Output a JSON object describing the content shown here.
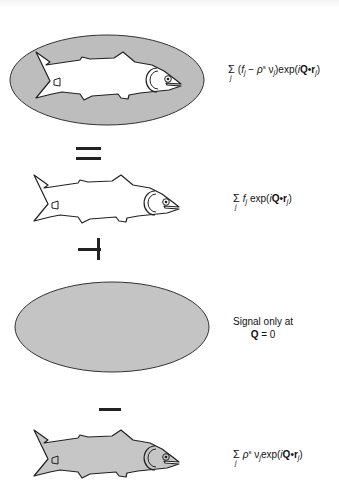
{
  "diagram": {
    "rows": [
      {
        "id": "fish-in-solvent",
        "shape": "ellipse+fish",
        "fish_fill": "#ffffff",
        "ellipse_fill": "#bdbdbd",
        "formula": {
          "sum_index": "j",
          "open": "(",
          "f": "f",
          "f_sub": "j",
          "minus": " − ",
          "rho": "ρ",
          "rho_sup": "s",
          "nu": " ν",
          "nu_sub": "j",
          "close": ")",
          "exp": "exp",
          "lp": "(",
          "i": "i",
          "Q": "Q",
          "dot": "•",
          "r": "r",
          "r_sub": "j",
          "rp": ")"
        }
      },
      {
        "id": "fish-in-vacuum",
        "operator": "=",
        "shape": "fish",
        "fish_fill": "#ffffff",
        "formula": {
          "sum_index": "j",
          "f": "f",
          "f_sub": "j",
          "exp": " exp",
          "lp": "(",
          "i": "i",
          "Q": "Q",
          "dot": "•",
          "r": "r",
          "r_sub": "j",
          "rp": ")"
        }
      },
      {
        "id": "solvent-ellipse",
        "operator": "+",
        "shape": "ellipse",
        "ellipse_fill": "#c4c4c4",
        "note": {
          "line1": "Signal only at",
          "Q": "Q",
          "eq": " = 0"
        }
      },
      {
        "id": "solvent-displaced-fish",
        "operator": "−",
        "shape": "fish",
        "fish_fill": "#c6c6c6",
        "formula": {
          "sum_index": "j",
          "rho": "ρ",
          "rho_sup": "s",
          "nu": " ν",
          "nu_sub": "j",
          "exp": "exp",
          "lp": "(",
          "i": "i",
          "Q": "Q",
          "dot": "•",
          "r": "r",
          "r_sub": "j",
          "rp": ")"
        }
      }
    ],
    "operators": {
      "equals": "=",
      "plus": "+",
      "minus": "−"
    }
  }
}
